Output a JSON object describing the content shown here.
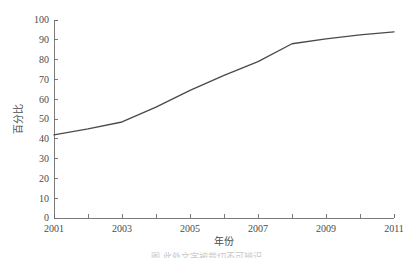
{
  "chart_data": {
    "type": "line",
    "title": "",
    "xlabel": "年份",
    "ylabel": "百分比",
    "xlim": [
      2001,
      2011
    ],
    "ylim": [
      0,
      100
    ],
    "grid": false,
    "legend": null,
    "line_color": "#4a4a4a",
    "axis_color": "#6d6d6d",
    "x": [
      2001,
      2002,
      2003,
      2004,
      2005,
      2006,
      2007,
      2008,
      2009,
      2010,
      2011
    ],
    "values": [
      42,
      45,
      48.5,
      56,
      64.5,
      72,
      79,
      88,
      90.5,
      92.5,
      94
    ],
    "series": [
      {
        "name": "百分比",
        "values": [
          42,
          45,
          48.5,
          56,
          64.5,
          72,
          79,
          88,
          90.5,
          92.5,
          94
        ]
      }
    ],
    "x_ticks": [
      2001,
      2002,
      2003,
      2004,
      2005,
      2006,
      2007,
      2008,
      2009,
      2010,
      2011
    ],
    "x_tick_labels": [
      "2001",
      "",
      "2003",
      "",
      "2005",
      "",
      "2007",
      "",
      "2009",
      "",
      "2011"
    ],
    "y_ticks": [
      0,
      10,
      20,
      30,
      40,
      50,
      60,
      70,
      80,
      90,
      100
    ],
    "y_tick_labels": [
      "0",
      "10",
      "20",
      "30",
      "40",
      "50",
      "60",
      "70",
      "80",
      "90",
      "100"
    ]
  },
  "footer": {
    "clipped_caption": "图 此处文字被裁切不可辨识"
  }
}
